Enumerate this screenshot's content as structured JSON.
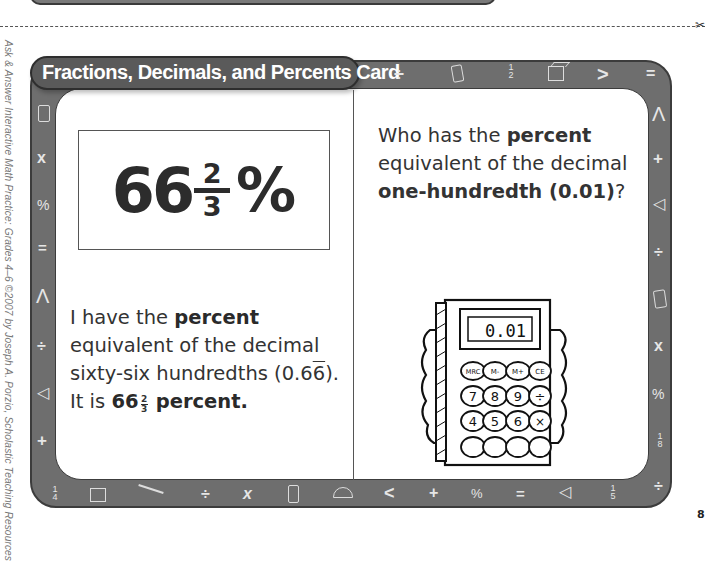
{
  "page": {
    "side_credit": "Ask & Answer Interactive Math Practice: Grades 4–6 ©2007 by Joseph A. Porzio, Scholastic Teaching Resources",
    "page_number": "8"
  },
  "card": {
    "title": "Fractions, Decimals, and Percents Card",
    "frame_color": "#6e6e6e",
    "tab_color": "#5a5a5a",
    "left": {
      "big_value": {
        "whole": "66",
        "numerator": "2",
        "denominator": "3",
        "symbol": "%"
      },
      "line1_pre": "I have the ",
      "line1_bold": "percent",
      "line2": "equivalent of the decimal",
      "line3_pre": "sixty-six hundredths (0.6",
      "line3_overline": "6",
      "line3_post": ").",
      "line4_pre": "It is ",
      "line4_whole": "66",
      "line4_num": "2",
      "line4_den": "3",
      "line4_bold": "percent",
      "line4_end": "."
    },
    "right": {
      "line1_pre": "Who has the ",
      "line1_bold": "percent",
      "line2": "equivalent of the decimal",
      "line3_bold": "one-hundredth (0.01)",
      "line3_end": "?",
      "calculator": {
        "display": "0.01",
        "keys_row1": [
          "MRC",
          "M-",
          "M+",
          "CE"
        ],
        "keys_row2": [
          "7",
          "8",
          "9",
          "÷"
        ],
        "keys_row3": [
          "4",
          "5",
          "6",
          "×"
        ]
      }
    },
    "border_icons": {
      "top": [
        "÷",
        "phone-shape",
        "1/2",
        "cube",
        ">",
        "="
      ],
      "left": [
        "phone-shape",
        "x",
        "%",
        "=",
        "compass",
        "÷",
        "triangle",
        "+",
        "1/4"
      ],
      "right": [
        "compass",
        "+",
        "triangle",
        "÷",
        "phone-shape",
        "x",
        "%",
        "1/8",
        "÷"
      ],
      "bottom": [
        "1/4",
        "cube",
        "compass",
        "÷",
        "x",
        "phone-shape",
        "protractor",
        "<",
        "+",
        "%",
        "=",
        "triangle",
        "1/5",
        "÷"
      ]
    }
  }
}
